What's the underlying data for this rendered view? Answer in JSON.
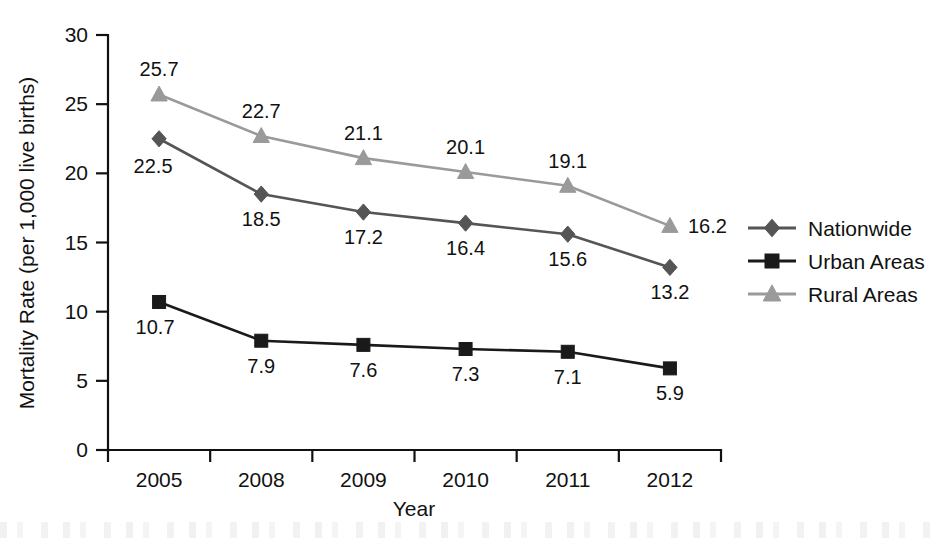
{
  "chart_data": {
    "type": "line",
    "title": "",
    "xlabel": "Year",
    "ylabel": "Mortality Rate (per 1,000 live births)",
    "categories": [
      "2005",
      "2008",
      "2009",
      "2010",
      "2011",
      "2012"
    ],
    "ylim": [
      0,
      30
    ],
    "yticks": [
      "0",
      "5",
      "10",
      "15",
      "20",
      "25",
      "30"
    ],
    "grid": false,
    "legend_position": "right",
    "series": [
      {
        "name": "Nationwide",
        "marker": "diamond",
        "color": "#555555",
        "label_position": "below",
        "values": [
          22.5,
          18.5,
          17.2,
          16.4,
          15.6,
          13.2
        ],
        "labels": [
          "22.5",
          "18.5",
          "17.2",
          "16.4",
          "15.6",
          "13.2"
        ]
      },
      {
        "name": "Urban Areas",
        "marker": "square",
        "color": "#1a1a1a",
        "label_position": "below",
        "values": [
          10.7,
          7.9,
          7.6,
          7.3,
          7.1,
          5.9
        ],
        "labels": [
          "10.7",
          "7.9",
          "7.6",
          "7.3",
          "7.1",
          "5.9"
        ]
      },
      {
        "name": "Rural Areas",
        "marker": "triangle",
        "color": "#9a9a9a",
        "label_position": "above",
        "values": [
          25.7,
          22.7,
          21.1,
          20.1,
          19.1,
          16.2
        ],
        "labels": [
          "25.7",
          "22.7",
          "21.1",
          "20.1",
          "19.1",
          "16.2"
        ]
      }
    ]
  },
  "legend": {
    "items": [
      {
        "label": "Nationwide",
        "color": "#555555",
        "marker": "diamond"
      },
      {
        "label": "Urban Areas",
        "color": "#1a1a1a",
        "marker": "square"
      },
      {
        "label": "Rural Areas",
        "color": "#9a9a9a",
        "marker": "triangle"
      }
    ]
  }
}
